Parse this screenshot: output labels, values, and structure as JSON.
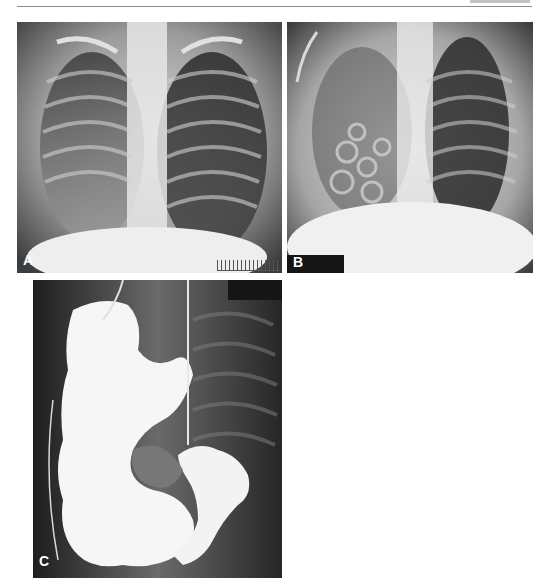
{
  "page": {
    "header_rule": true
  },
  "figures": [
    {
      "id": "A",
      "label": "A",
      "description": "Chest radiograph, frontal view, infant",
      "has_scale_ruler": true
    },
    {
      "id": "B",
      "label": "B",
      "description": "Chest radiograph, frontal view, with bubbly lucencies in right hemithorax",
      "has_redaction_box": true
    },
    {
      "id": "C",
      "label": "C",
      "description": "Contrast study showing contrast-filled bowel loops in chest, with tubes",
      "has_redaction_box": true
    }
  ]
}
